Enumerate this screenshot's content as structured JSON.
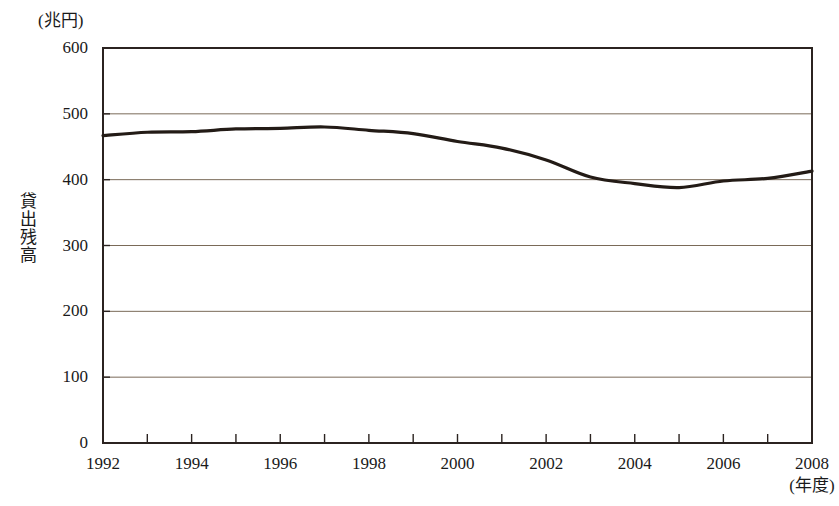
{
  "chart_data": {
    "type": "line",
    "title": "",
    "subtitle": "",
    "unit_label": "(兆円)",
    "ylabel": "貸出残高",
    "xlabel": "(年度)",
    "x": [
      1992,
      1993,
      1994,
      1995,
      1996,
      1997,
      1998,
      1999,
      2000,
      2001,
      2002,
      2003,
      2004,
      2005,
      2006,
      2007,
      2008
    ],
    "values": [
      467,
      472,
      473,
      477,
      478,
      480,
      475,
      470,
      458,
      448,
      430,
      404,
      394,
      388,
      398,
      402,
      413
    ],
    "series": [
      {
        "name": "貸出残高",
        "values": [
          467,
          472,
          473,
          477,
          478,
          480,
          475,
          470,
          458,
          448,
          430,
          404,
          394,
          388,
          398,
          402,
          413
        ]
      }
    ],
    "xlim": [
      1992,
      2008
    ],
    "ylim": [
      0,
      600
    ],
    "ytick_labels": [
      "600",
      "500",
      "400",
      "300",
      "200",
      "100",
      "0"
    ],
    "yticks": [
      600,
      500,
      400,
      300,
      200,
      100,
      0
    ],
    "xtick_labels": [
      "1992",
      "1994",
      "1996",
      "1998",
      "2000",
      "2002",
      "2004",
      "2006",
      "2008"
    ],
    "xticks": [
      1992,
      1994,
      1996,
      1998,
      2000,
      2002,
      2004,
      2006,
      2008
    ],
    "minor_xticks": [
      1993,
      1995,
      1997,
      1999,
      2001,
      2003,
      2005,
      2007
    ],
    "grid": "horizontal",
    "legend": null,
    "legend_position": "none",
    "line_color": "#231b16",
    "grid_color": "#7a6a58",
    "axis_color": "#2b2320",
    "background_color": "#ffffff"
  }
}
